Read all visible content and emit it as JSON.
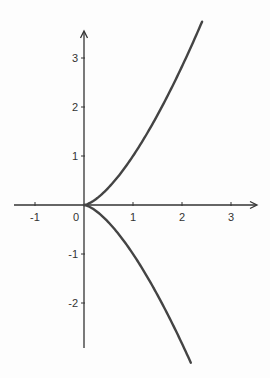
{
  "chart_data": {
    "type": "line",
    "title": "",
    "xlabel": "",
    "ylabel": "",
    "equation": "y^2 = x^3",
    "xlim": [
      -1.5,
      3.5
    ],
    "ylim": [
      -2.9,
      3.5
    ],
    "grid": false,
    "legend": null,
    "x_ticks": [
      -1,
      0,
      1,
      2,
      3
    ],
    "y_ticks": [
      3,
      2,
      1,
      -1,
      -2
    ],
    "x_tick_labels": [
      "-1",
      "0",
      "1",
      "2",
      "3"
    ],
    "y_tick_labels": [
      "3",
      "2",
      "1",
      "-1",
      "-2"
    ],
    "series": [
      {
        "name": "upper branch",
        "x": [
          0,
          0.25,
          0.5,
          0.75,
          1,
          1.25,
          1.5,
          1.75,
          2,
          2.2,
          2.41
        ],
        "y": [
          0,
          0.125,
          0.354,
          0.65,
          1,
          1.398,
          1.837,
          2.315,
          2.828,
          3.263,
          3.741
        ]
      },
      {
        "name": "lower branch",
        "x": [
          0,
          0.25,
          0.5,
          0.75,
          1,
          1.25,
          1.5,
          1.75,
          2,
          2.18
        ],
        "y": [
          0,
          -0.125,
          -0.354,
          -0.65,
          -1,
          -1.398,
          -1.837,
          -2.315,
          -2.828,
          -3.219
        ]
      }
    ],
    "colors": {
      "axis": "#333333",
      "curve": "#444444",
      "background": "#fdfdfd"
    }
  }
}
